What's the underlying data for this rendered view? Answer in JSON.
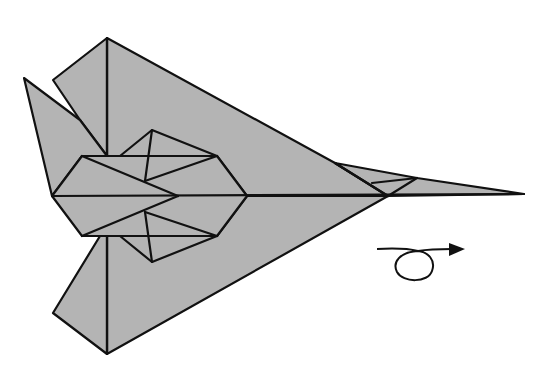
{
  "diagram": {
    "colors": {
      "paper": "#b4b4b4",
      "line": "#111111",
      "background": "#ffffff"
    },
    "symbols": [
      {
        "name": "turn-over-symbol",
        "meaning": "turn the model over",
        "position": [
          420,
          262
        ]
      }
    ],
    "outline": {
      "top_peak": [
        107,
        38
      ],
      "upper_flap_tip": [
        53,
        80
      ],
      "left_spike_tip": [
        24,
        78
      ],
      "bottom_peak": [
        107,
        354
      ],
      "lower_flap_tip": [
        53,
        313
      ],
      "nose_tip": [
        524,
        194
      ],
      "body_junction": [
        388,
        196
      ]
    },
    "caption": "Turn over."
  }
}
